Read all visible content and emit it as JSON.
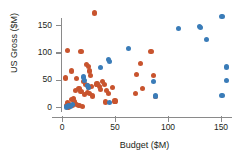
{
  "chart_data": {
    "type": "scatter",
    "title": "",
    "xlabel": "Budget ($M)",
    "ylabel": "US Gross ($M)",
    "xlim": [
      -8,
      160
    ],
    "ylim": [
      -12,
      180
    ],
    "xticks": [
      0,
      50,
      100,
      150
    ],
    "yticks": [
      0,
      50,
      100,
      150
    ],
    "xtick_labels": [
      "0",
      "50",
      "100",
      "150"
    ],
    "ytick_labels": [
      "0",
      "50",
      "100",
      "150"
    ],
    "grid": false,
    "legend": "none",
    "colors": {
      "orange": "#c8542e",
      "blue": "#3a7cb8",
      "axis": "#8a8a8a",
      "text": "#231f20"
    },
    "series": [
      {
        "name": "orange",
        "color": "#c8542e",
        "points": [
          [
            31,
            172
          ],
          [
            5,
            103
          ],
          [
            18,
            101
          ],
          [
            3,
            53
          ],
          [
            9,
            66
          ],
          [
            23,
            78
          ],
          [
            25,
            74
          ],
          [
            26,
            66
          ],
          [
            27,
            57
          ],
          [
            14,
            52
          ],
          [
            20,
            47
          ],
          [
            22,
            41
          ],
          [
            24,
            40
          ],
          [
            25,
            36
          ],
          [
            28,
            38
          ],
          [
            33,
            42
          ],
          [
            35,
            37
          ],
          [
            36,
            32
          ],
          [
            38,
            47
          ],
          [
            40,
            41
          ],
          [
            42,
            30
          ],
          [
            44,
            24
          ],
          [
            48,
            35
          ],
          [
            50,
            11
          ],
          [
            41,
            9
          ],
          [
            29,
            20
          ],
          [
            26,
            24
          ],
          [
            24,
            27
          ],
          [
            21,
            23
          ],
          [
            18,
            29
          ],
          [
            16,
            34
          ],
          [
            13,
            30
          ],
          [
            11,
            16
          ],
          [
            9,
            14
          ],
          [
            12,
            9
          ],
          [
            14,
            5
          ],
          [
            10,
            3
          ],
          [
            7,
            5
          ],
          [
            5,
            8
          ],
          [
            4,
            2
          ],
          [
            6,
            0
          ],
          [
            16,
            2
          ],
          [
            19,
            1
          ],
          [
            70,
            59
          ],
          [
            74,
            80
          ],
          [
            76,
            34
          ],
          [
            69,
            24
          ],
          [
            84,
            101
          ],
          [
            86,
            57
          ],
          [
            88,
            19
          ]
        ]
      },
      {
        "name": "blue",
        "color": "#3a7cb8",
        "points": [
          [
            110,
            143
          ],
          [
            130,
            147
          ],
          [
            131,
            145
          ],
          [
            151,
            166
          ],
          [
            136,
            124
          ],
          [
            63,
            107
          ],
          [
            44,
            87
          ],
          [
            45,
            83
          ],
          [
            36,
            72
          ],
          [
            20,
            55
          ],
          [
            21,
            49
          ],
          [
            24,
            39
          ],
          [
            25,
            36
          ],
          [
            10,
            4
          ],
          [
            8,
            1
          ],
          [
            4,
            0
          ],
          [
            6,
            2
          ],
          [
            45,
            8
          ],
          [
            88,
            20
          ],
          [
            86,
            46
          ],
          [
            155,
            73
          ],
          [
            155,
            49
          ],
          [
            151,
            21
          ]
        ]
      }
    ]
  }
}
